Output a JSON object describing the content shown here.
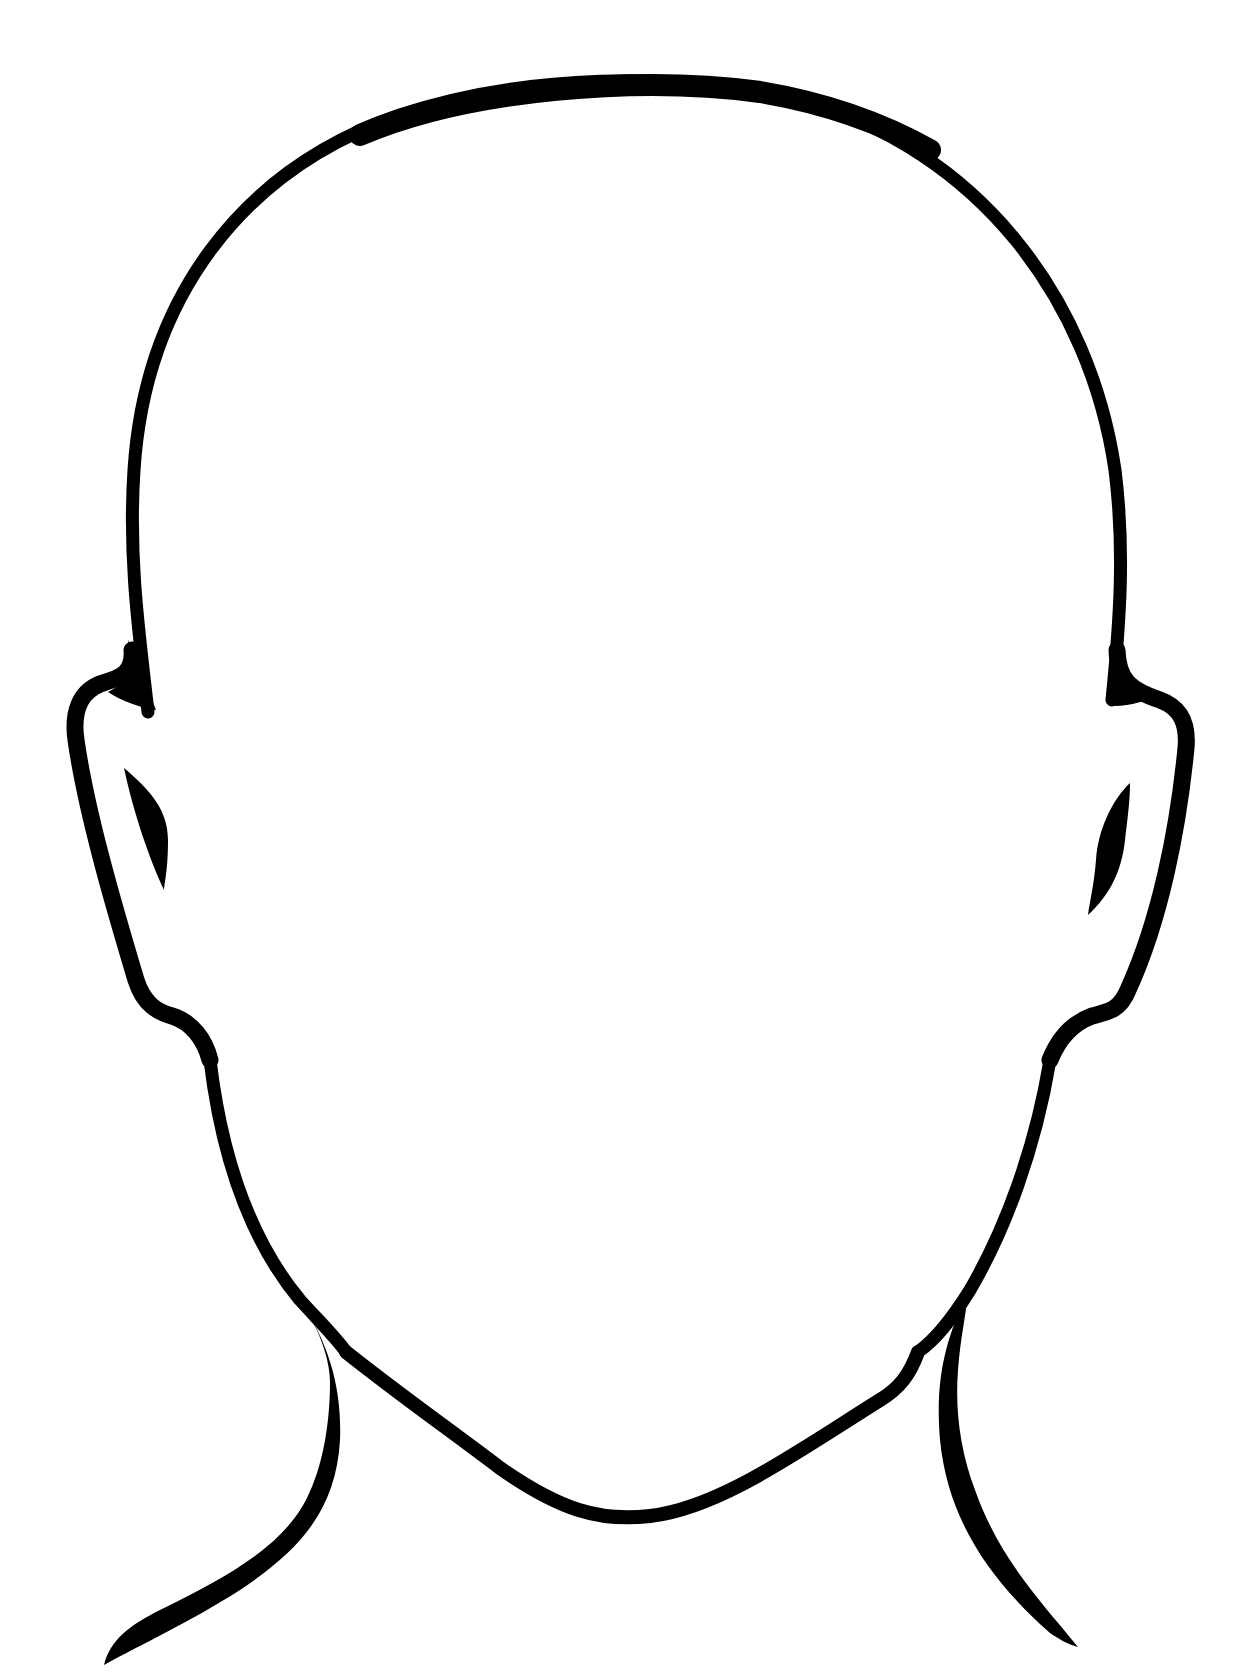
{
  "image": {
    "subject": "blank face outline",
    "description": "Black line-art outline of a bald human head with ears, jaw and neck, no facial features",
    "colors": {
      "background": "#ffffff",
      "ink": "#000000"
    },
    "parts": [
      "head-outline",
      "left-ear",
      "right-ear",
      "left-ear-inner",
      "right-ear-inner",
      "jawline",
      "neck-left",
      "neck-right"
    ]
  }
}
